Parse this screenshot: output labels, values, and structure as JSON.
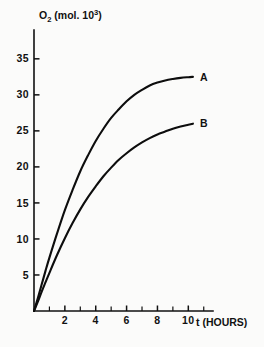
{
  "chart_data": {
    "type": "line",
    "title": "",
    "xlabel": "t (HOURS)",
    "ylabel": "O2 (mol. 10^3)",
    "ylabel_parts": {
      "base": "O",
      "subscript": "2",
      "unit_open": " (mol. 10",
      "superscript": "3",
      "unit_close": ")"
    },
    "xlim": [
      0,
      11.6
    ],
    "ylim": [
      0,
      39
    ],
    "grid": false,
    "legend_position": "inline-right-of-curve-ends",
    "x_ticks_major": [
      2,
      4,
      6,
      8,
      10
    ],
    "x_tick_labels": [
      "2",
      "4",
      "6",
      "8",
      "10"
    ],
    "x_ticks_minor": [
      1,
      3,
      5,
      7,
      9,
      11
    ],
    "y_ticks_major": [
      5,
      10,
      15,
      20,
      25,
      30,
      35
    ],
    "y_tick_labels": [
      "5",
      "10",
      "15",
      "20",
      "25",
      "30",
      "35"
    ],
    "series": [
      {
        "name": "A",
        "label": "A",
        "color": "#0d0d0d",
        "plateau": 32.5,
        "x": [
          0,
          0.25,
          0.5,
          0.75,
          1,
          1.5,
          2,
          2.5,
          3,
          3.5,
          4,
          4.5,
          5,
          5.5,
          6,
          6.5,
          7,
          7.5,
          8,
          8.5,
          9,
          9.5,
          10,
          10.3
        ],
        "y": [
          0,
          1.8,
          3.7,
          5.6,
          7.4,
          10.8,
          14.0,
          16.8,
          19.4,
          21.6,
          23.6,
          25.3,
          26.8,
          28.0,
          29.1,
          30.0,
          30.7,
          31.3,
          31.7,
          32.0,
          32.2,
          32.35,
          32.45,
          32.5
        ]
      },
      {
        "name": "B",
        "label": "B",
        "color": "#0d0d0d",
        "plateau": 26.0,
        "x": [
          0,
          0.25,
          0.5,
          0.75,
          1,
          1.5,
          2,
          2.5,
          3,
          3.5,
          4,
          4.5,
          5,
          5.5,
          6,
          6.5,
          7,
          7.5,
          8,
          8.5,
          9,
          9.5,
          10,
          10.3
        ],
        "y": [
          0,
          1.3,
          2.7,
          4.0,
          5.3,
          7.8,
          10.1,
          12.2,
          14.1,
          15.8,
          17.3,
          18.7,
          19.9,
          21.0,
          21.9,
          22.7,
          23.4,
          24.0,
          24.5,
          24.9,
          25.3,
          25.6,
          25.85,
          26.0
        ]
      }
    ]
  },
  "axis": {
    "x_axis_name": "time-axis",
    "y_axis_name": "oxygen-axis"
  }
}
